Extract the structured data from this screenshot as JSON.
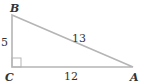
{
  "diagram": {
    "type": "right-triangle",
    "vertices": {
      "A": {
        "label": "A",
        "x": 133,
        "y": 67
      },
      "B": {
        "label": "B",
        "x": 12,
        "y": 15
      },
      "C": {
        "label": "C",
        "x": 12,
        "y": 67
      }
    },
    "sides": {
      "BC": {
        "label": "5"
      },
      "AB": {
        "label": "13"
      },
      "CA": {
        "label": "12"
      }
    },
    "right_angle_at": "C",
    "colors": {
      "line": "#b5b5b5",
      "text": "#333333"
    }
  }
}
